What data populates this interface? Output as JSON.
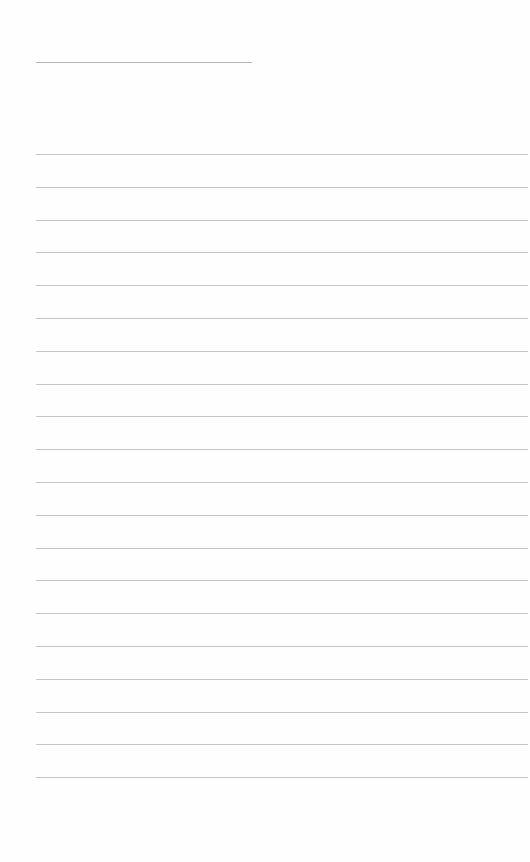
{
  "page": {
    "type": "blank-lined-sheet",
    "title_line": {
      "text": ""
    },
    "ruled_lines": {
      "count": 20,
      "first_y": 154,
      "spacing": 32.8,
      "left": 36,
      "right": 528
    },
    "lines": [
      "",
      "",
      "",
      "",
      "",
      "",
      "",
      "",
      "",
      "",
      "",
      "",
      "",
      "",
      "",
      "",
      "",
      "",
      "",
      ""
    ],
    "colors": {
      "background": "#fefefe",
      "rule": "#c4c4c4",
      "title_rule": "#b5b5b5"
    }
  }
}
